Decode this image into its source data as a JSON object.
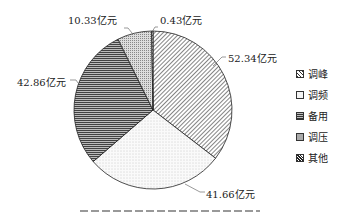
{
  "chart_data": {
    "type": "pie",
    "categories": [
      "调峰",
      "调频",
      "备用",
      "调压",
      "其他"
    ],
    "values": [
      52.34,
      41.66,
      42.86,
      10.33,
      0.43
    ],
    "unit": "亿元",
    "data_labels": [
      "52.34亿元",
      "41.66亿元",
      "42.86亿元",
      "10.33亿元",
      "0.43亿元"
    ],
    "legend": [
      "调峰",
      "调频",
      "备用",
      "调压",
      "其他"
    ],
    "legend_position": "right",
    "start_angle_deg": 0,
    "direction": "clockwise"
  },
  "labels": {
    "peak": "52.34亿元",
    "freq": "41.66亿元",
    "reserve": "42.86亿元",
    "voltage": "10.33亿元",
    "other": "0.43亿元"
  },
  "legend": {
    "items": [
      {
        "label": "调峰"
      },
      {
        "label": "调频"
      },
      {
        "label": "备用"
      },
      {
        "label": "调压"
      },
      {
        "label": "其他"
      }
    ]
  }
}
